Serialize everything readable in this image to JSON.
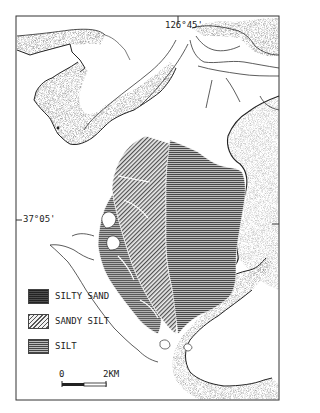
{
  "map": {
    "coordinates": {
      "longitude_label": "126°45'",
      "latitude_label": "37°05'"
    },
    "legend": {
      "items": [
        {
          "label": "SILTY SAND",
          "pattern": "dotted-horizontal"
        },
        {
          "label": "SANDY SILT",
          "pattern": "diagonal-hatch"
        },
        {
          "label": "SILT",
          "pattern": "horizontal-lines"
        }
      ]
    },
    "scale_bar": {
      "start_label": "0",
      "end_label": "2KM"
    },
    "colors": {
      "background": "#ffffff",
      "ink": "#222222",
      "silt": "#6b6b6b",
      "sandy_silt": "#9a9a9a",
      "silty_sand": "#7c7c7c",
      "coast_stipple": "#555555"
    }
  }
}
